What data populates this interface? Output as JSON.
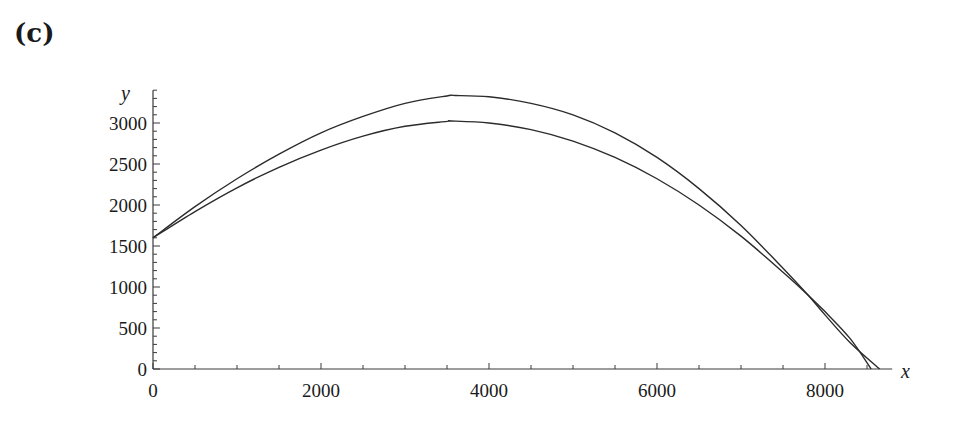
{
  "panel_label": "(c)",
  "chart_data": {
    "type": "line",
    "title": "",
    "xlabel": "x",
    "ylabel": "y",
    "xlim": [
      0,
      8800
    ],
    "ylim": [
      0,
      3400
    ],
    "grid": false,
    "legend": null,
    "x_ticks": [
      0,
      2000,
      4000,
      6000,
      8000
    ],
    "y_ticks": [
      0,
      500,
      1000,
      1500,
      2000,
      2500,
      3000
    ],
    "series": [
      {
        "name": "upper trajectory",
        "x": [
          0,
          500,
          1000,
          1500,
          2000,
          2500,
          3000,
          3500,
          3600,
          4000,
          4500,
          5000,
          5500,
          6000,
          6500,
          7000,
          7500,
          7800,
          8000,
          8300,
          8650
        ],
        "y": [
          1600,
          1980,
          2320,
          2620,
          2880,
          3080,
          3240,
          3330,
          3335,
          3320,
          3240,
          3100,
          2880,
          2580,
          2200,
          1750,
          1230,
          900,
          660,
          320,
          0
        ]
      },
      {
        "name": "lower trajectory",
        "x": [
          0,
          500,
          1000,
          1500,
          2000,
          2500,
          3000,
          3500,
          3550,
          4000,
          4500,
          5000,
          5500,
          6000,
          6500,
          7000,
          7500,
          7800,
          8000,
          8300,
          8550
        ],
        "y": [
          1600,
          1920,
          2210,
          2460,
          2670,
          2840,
          2960,
          3020,
          3025,
          3000,
          2920,
          2780,
          2580,
          2320,
          2000,
          1620,
          1180,
          900,
          700,
          370,
          0
        ]
      }
    ]
  },
  "axes": {
    "x_label": "x",
    "y_label": "y",
    "x_tick_labels": [
      "0",
      "2000",
      "4000",
      "6000",
      "8000"
    ],
    "y_tick_labels": [
      "0",
      "500",
      "1000",
      "1500",
      "2000",
      "2500",
      "3000"
    ]
  }
}
